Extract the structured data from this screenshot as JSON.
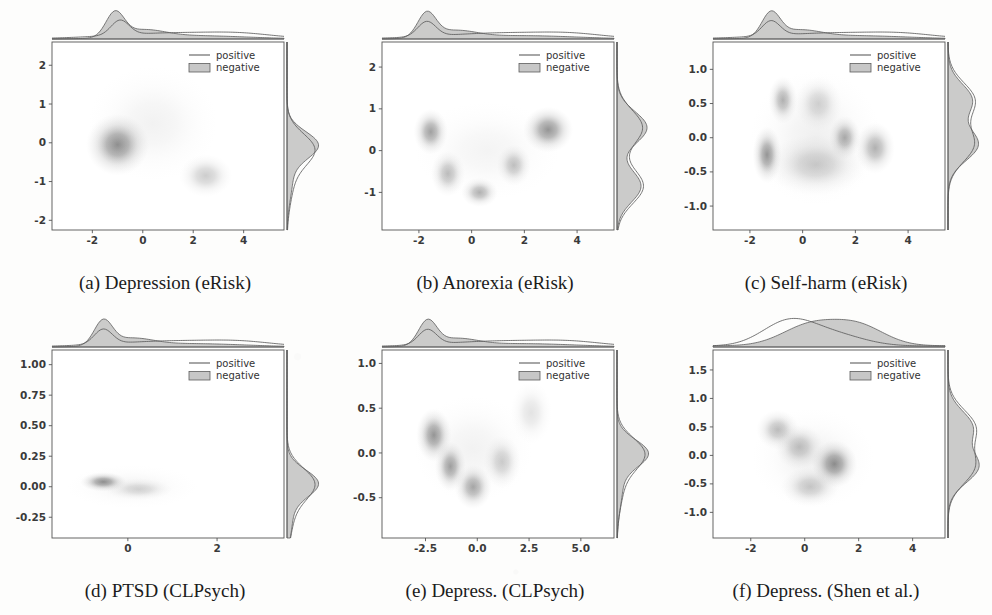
{
  "figure": {
    "type": "multi-panel-joint-density-figure",
    "panel_count": 6,
    "rows": 2,
    "columns": 3,
    "legend_entries": [
      "positive",
      "negative"
    ],
    "colors": {
      "density_dark": "#4a4a4a",
      "density_mid": "#8a8a8a",
      "density_light": "#c9c9c9",
      "marginal_fill": "#b9b9b9",
      "marginal_line": "#5d5d5d",
      "axis": "#555555",
      "text": "#333333",
      "page_background": "#fdfdfc"
    }
  },
  "chart_data": [
    {
      "id": "a",
      "type": "scatter",
      "title": "(a) Depression (eRisk)",
      "caption": "(a) Depression (eRisk)",
      "dataset": "eRisk",
      "condition": "Depression",
      "xlabel": "",
      "ylabel": "",
      "grid": false,
      "legend_position": "upper right",
      "legend": [
        "positive",
        "negative"
      ],
      "xticks": [
        "-2",
        "0",
        "2",
        "4"
      ],
      "xtick_values": [
        -2,
        0,
        2,
        4
      ],
      "yticks": [
        "2",
        "1",
        "0",
        "-1",
        "-2"
      ],
      "ytick_values": [
        2,
        1,
        0,
        -1,
        -2
      ],
      "xlim": [
        -3.6,
        5.6
      ],
      "ylim": [
        -2.25,
        2.6
      ],
      "marginal_x": {
        "negative_peak_x": -1.1,
        "negative_peak_height": 1.0,
        "positive_peak_x": -0.9,
        "positive_shape": "sharp peak near -1 with long flat right tail to x=5"
      },
      "marginal_y": {
        "negative_peak_y": -0.05,
        "positive_peak_y": -0.15,
        "positive_shape": "single peak near 0 with tail toward -1"
      },
      "density_blobs": [
        {
          "cx": -1.0,
          "cy": -0.05,
          "rx": 1.25,
          "ry": 0.8,
          "intensity": 1.0,
          "label": "main cluster"
        },
        {
          "cx": 2.5,
          "cy": -0.85,
          "rx": 1.05,
          "ry": 0.55,
          "intensity": 0.45,
          "label": "secondary cluster"
        },
        {
          "cx": 0.4,
          "cy": 0.5,
          "rx": 2.6,
          "ry": 1.5,
          "intensity": 0.12,
          "label": "diffuse halo"
        }
      ]
    },
    {
      "id": "b",
      "type": "scatter",
      "title": "(b) Anorexia (eRisk)",
      "caption": "(b) Anorexia (eRisk)",
      "dataset": "eRisk",
      "condition": "Anorexia",
      "xlabel": "",
      "ylabel": "",
      "grid": false,
      "legend_position": "upper right",
      "legend": [
        "positive",
        "negative"
      ],
      "xticks": [
        "-2",
        "0",
        "2",
        "4"
      ],
      "xtick_values": [
        -2,
        0,
        2,
        4
      ],
      "yticks": [
        "2",
        "1",
        "0",
        "-1"
      ],
      "ytick_values": [
        2,
        1,
        0,
        -1
      ],
      "xlim": [
        -3.4,
        5.4
      ],
      "ylim": [
        -1.9,
        2.6
      ],
      "marginal_x": {
        "negative_peak_x": -1.7,
        "negative_peak_height": 1.0,
        "positive_shape": "sharp peak near -1.7 plus broad plateau from 0 to 4"
      },
      "marginal_y": {
        "negative_peak_y": 0.55,
        "secondary_peak_y": -0.85,
        "positive_shape": "bimodal with peaks near 0.6 and -0.9"
      },
      "density_blobs": [
        {
          "cx": -1.55,
          "cy": 0.45,
          "rx": 0.65,
          "ry": 0.55,
          "intensity": 0.85,
          "label": "left arm top"
        },
        {
          "cx": -0.9,
          "cy": -0.55,
          "rx": 0.65,
          "ry": 0.55,
          "intensity": 0.6,
          "label": "left arm descending"
        },
        {
          "cx": 0.3,
          "cy": -1.0,
          "rx": 0.7,
          "ry": 0.35,
          "intensity": 0.7,
          "label": "V vertex"
        },
        {
          "cx": 1.6,
          "cy": -0.35,
          "rx": 0.65,
          "ry": 0.5,
          "intensity": 0.55,
          "label": "right arm ascending"
        },
        {
          "cx": 2.9,
          "cy": 0.5,
          "rx": 0.95,
          "ry": 0.55,
          "intensity": 0.95,
          "label": "right arm top"
        },
        {
          "cx": 0.6,
          "cy": 0.0,
          "rx": 2.8,
          "ry": 1.2,
          "intensity": 0.1,
          "label": "diffuse halo"
        }
      ],
      "shape": "V-shaped / U-shaped manifold"
    },
    {
      "id": "c",
      "type": "scatter",
      "title": "(c) Self-harm (eRisk)",
      "caption": "(c) Self-harm (eRisk)",
      "dataset": "eRisk",
      "condition": "Self-harm",
      "xlabel": "",
      "ylabel": "",
      "grid": false,
      "legend_position": "upper right",
      "legend": [
        "positive",
        "negative"
      ],
      "xticks": [
        "-2",
        "0",
        "2",
        "4"
      ],
      "xtick_values": [
        -2,
        0,
        2,
        4
      ],
      "yticks": [
        "1.0",
        "0.5",
        "0.0",
        "-0.5",
        "-1.0"
      ],
      "ytick_values": [
        1.0,
        0.5,
        0.0,
        -0.5,
        -1.0
      ],
      "xlim": [
        -3.4,
        5.4
      ],
      "ylim": [
        -1.35,
        1.4
      ],
      "marginal_x": {
        "negative_peak_x": -1.2,
        "positive_shape": "sharp peak near -1.2 plus broad right shoulder to x=4"
      },
      "marginal_y": {
        "negative_peak_y": -0.1,
        "secondary_peak_y": 0.55,
        "positive_shape": "bimodal peaks near 0.55 and -0.1"
      },
      "density_blobs": [
        {
          "cx": -1.35,
          "cy": -0.25,
          "rx": 0.55,
          "ry": 0.42,
          "intensity": 0.95,
          "label": "left vertex"
        },
        {
          "cx": -0.75,
          "cy": 0.55,
          "rx": 0.55,
          "ry": 0.35,
          "intensity": 0.7,
          "label": "upper left edge"
        },
        {
          "cx": 0.6,
          "cy": 0.5,
          "rx": 0.9,
          "ry": 0.4,
          "intensity": 0.4,
          "label": "upper ridge"
        },
        {
          "cx": 1.6,
          "cy": 0.0,
          "rx": 0.6,
          "ry": 0.32,
          "intensity": 0.75,
          "label": "central right"
        },
        {
          "cx": 2.75,
          "cy": -0.15,
          "rx": 0.75,
          "ry": 0.38,
          "intensity": 0.7,
          "label": "right vertex"
        },
        {
          "cx": 0.5,
          "cy": -0.4,
          "rx": 1.9,
          "ry": 0.45,
          "intensity": 0.45,
          "label": "lower edge"
        },
        {
          "cx": 0.5,
          "cy": 0.0,
          "rx": 2.5,
          "ry": 1.0,
          "intensity": 0.14,
          "label": "diffuse halo"
        }
      ],
      "shape": "triangular manifold"
    },
    {
      "id": "d",
      "type": "scatter",
      "title": "(d) PTSD (CLPsych)",
      "caption": "(d) PTSD (CLPsych)",
      "dataset": "CLPsych",
      "condition": "PTSD",
      "xlabel": "",
      "ylabel": "",
      "grid": false,
      "legend_position": "upper right",
      "legend": [
        "positive",
        "negative"
      ],
      "xticks": [
        "0",
        "2"
      ],
      "xtick_values": [
        0,
        2
      ],
      "yticks": [
        "1.00",
        "0.75",
        "0.50",
        "0.25",
        "0.00",
        "-0.25"
      ],
      "ytick_values": [
        1.0,
        0.75,
        0.5,
        0.25,
        0.0,
        -0.25
      ],
      "xlim": [
        -1.7,
        3.5
      ],
      "ylim": [
        -0.42,
        1.12
      ],
      "marginal_x": {
        "negative_peak_x": -0.55,
        "positive_shape": "sharp peak near -0.5 with long thin right tail"
      },
      "marginal_y": {
        "negative_peak_y": 0.03,
        "positive_shape": "narrow single peak at 0.0"
      },
      "density_blobs": [
        {
          "cx": -0.55,
          "cy": 0.04,
          "rx": 0.52,
          "ry": 0.08,
          "intensity": 1.0,
          "label": "main cluster"
        },
        {
          "cx": 0.25,
          "cy": -0.02,
          "rx": 0.75,
          "ry": 0.09,
          "intensity": 0.35,
          "label": "right tail"
        },
        {
          "cx": 0.1,
          "cy": 0.0,
          "rx": 1.5,
          "ry": 0.18,
          "intensity": 0.1,
          "label": "diffuse halo"
        }
      ]
    },
    {
      "id": "e",
      "type": "scatter",
      "title": "(e) Depress. (CLPsych)",
      "caption": "(e) Depress. (CLPsych)",
      "dataset": "CLPsych",
      "condition": "Depression",
      "xlabel": "",
      "ylabel": "",
      "grid": false,
      "legend_position": "upper right",
      "legend": [
        "positive",
        "negative"
      ],
      "xticks": [
        "-2.5",
        "0.0",
        "2.5",
        "5.0"
      ],
      "xtick_values": [
        -2.5,
        0.0,
        2.5,
        5.0
      ],
      "yticks": [
        "1.0",
        "0.5",
        "0.0",
        "-0.5"
      ],
      "ytick_values": [
        1.0,
        0.5,
        0.0,
        -0.5
      ],
      "xlim": [
        -4.6,
        6.6
      ],
      "ylim": [
        -0.95,
        1.15
      ],
      "marginal_x": {
        "negative_peak_x": -2.4,
        "positive_shape": "peak near -2.4 with long right skew to x=5"
      },
      "marginal_y": {
        "negative_peak_y": 0.0,
        "positive_shape": "broad single peak near 0.05"
      },
      "density_blobs": [
        {
          "cx": -2.1,
          "cy": 0.2,
          "rx": 0.85,
          "ry": 0.3,
          "intensity": 0.95,
          "label": "left arm"
        },
        {
          "cx": -1.3,
          "cy": -0.15,
          "rx": 0.75,
          "ry": 0.28,
          "intensity": 0.85,
          "label": "left descending"
        },
        {
          "cx": -0.2,
          "cy": -0.38,
          "rx": 0.9,
          "ry": 0.25,
          "intensity": 0.8,
          "label": "V vertex"
        },
        {
          "cx": 1.2,
          "cy": -0.1,
          "rx": 0.9,
          "ry": 0.3,
          "intensity": 0.45,
          "label": "right ascending"
        },
        {
          "cx": 2.6,
          "cy": 0.45,
          "rx": 1.0,
          "ry": 0.35,
          "intensity": 0.25,
          "label": "right arm"
        },
        {
          "cx": -0.2,
          "cy": 0.05,
          "rx": 2.9,
          "ry": 0.6,
          "intensity": 0.12,
          "label": "diffuse halo"
        }
      ],
      "shape": "V-shaped manifold"
    },
    {
      "id": "f",
      "type": "scatter",
      "title": "(f) Depress. (Shen et al.)",
      "caption": "(f) Depress. (Shen et al.)",
      "dataset": "Shen et al.",
      "condition": "Depression",
      "xlabel": "",
      "ylabel": "",
      "grid": false,
      "legend_position": "upper right",
      "legend": [
        "positive",
        "negative"
      ],
      "xticks": [
        "-2",
        "0",
        "2",
        "4"
      ],
      "xtick_values": [
        -2,
        0,
        2,
        4
      ],
      "yticks": [
        "1.5",
        "1.0",
        "0.5",
        "0.0",
        "-0.5",
        "-1.0"
      ],
      "ytick_values": [
        1.5,
        1.0,
        0.5,
        0.0,
        -0.5,
        -1.0
      ],
      "xlim": [
        -3.4,
        5.2
      ],
      "ylim": [
        -1.45,
        1.85
      ],
      "marginal_x": {
        "negative_peak_x": 0.2,
        "secondary_peak_x": 2.0,
        "positive_peak_x": -0.6,
        "positive_shape": "broad bimodal, positive peaks left of negative"
      },
      "marginal_y": {
        "negative_peak_y": -0.2,
        "secondary_peak_y": 0.5,
        "positive_shape": "bimodal peaks near 0.5 and -0.25"
      },
      "density_blobs": [
        {
          "cx": -1.0,
          "cy": 0.45,
          "rx": 0.8,
          "ry": 0.35,
          "intensity": 0.6,
          "label": "upper left arm"
        },
        {
          "cx": -0.2,
          "cy": 0.15,
          "rx": 0.9,
          "ry": 0.4,
          "intensity": 0.55,
          "label": "mid band"
        },
        {
          "cx": 1.1,
          "cy": -0.15,
          "rx": 0.85,
          "ry": 0.42,
          "intensity": 1.0,
          "label": "main cluster"
        },
        {
          "cx": 0.2,
          "cy": -0.55,
          "rx": 1.1,
          "ry": 0.35,
          "intensity": 0.5,
          "label": "lower arm"
        },
        {
          "cx": 0.3,
          "cy": -0.05,
          "rx": 2.3,
          "ry": 0.9,
          "intensity": 0.13,
          "label": "diffuse halo"
        }
      ],
      "shape": "triangular manifold"
    }
  ]
}
